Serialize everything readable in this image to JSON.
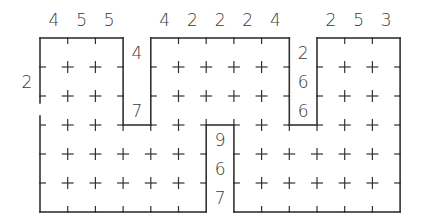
{
  "puzzle": {
    "grid": {
      "cols": 13,
      "rows": 6,
      "x0": 40,
      "y0": 38,
      "cell_w": 27.7,
      "cell_h": 29
    },
    "colors": {
      "line": "#333333",
      "text": "#3a3a3a",
      "background": "#ffffff"
    },
    "top_clues": [
      {
        "col": 0,
        "value": "4"
      },
      {
        "col": 1,
        "value": "5"
      },
      {
        "col": 2,
        "value": "5"
      },
      {
        "col": 4,
        "value": "4"
      },
      {
        "col": 5,
        "value": "2"
      },
      {
        "col": 6,
        "value": "2"
      },
      {
        "col": 7,
        "value": "2"
      },
      {
        "col": 8,
        "value": "4"
      },
      {
        "col": 10,
        "value": "2"
      },
      {
        "col": 11,
        "value": "5"
      },
      {
        "col": 12,
        "value": "3"
      }
    ],
    "left_clues": [
      {
        "row": 1,
        "value": "2"
      }
    ],
    "notch_clues": [
      {
        "col": 3,
        "row": 0,
        "value": "4"
      },
      {
        "col": 3,
        "row": 2,
        "value": "7"
      },
      {
        "col": 9,
        "row": 0,
        "value": "2"
      },
      {
        "col": 9,
        "row": 1,
        "value": "6"
      },
      {
        "col": 9,
        "row": 2,
        "value": "6"
      },
      {
        "col": 6,
        "row": 3,
        "value": "9"
      },
      {
        "col": 6,
        "row": 4,
        "value": "6"
      },
      {
        "col": 6,
        "row": 5,
        "value": "7"
      }
    ]
  }
}
